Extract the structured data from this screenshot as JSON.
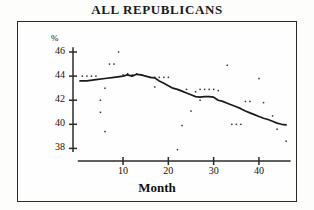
{
  "chart_data": {
    "type": "scatter",
    "title": "ALL REPUBLICANS",
    "xlabel": "Month",
    "ylabel": "%",
    "xlim": [
      0,
      48
    ],
    "ylim": [
      37.2,
      46.6
    ],
    "xticks": [
      10,
      20,
      30,
      40
    ],
    "yticks": [
      38,
      40,
      42,
      44,
      46
    ],
    "grid": false,
    "legend": null,
    "series": [
      {
        "name": "Monthly observations",
        "type": "scatter",
        "points": [
          [
            1,
            44.0
          ],
          [
            2,
            44.0
          ],
          [
            3,
            44.0
          ],
          [
            4,
            44.0
          ],
          [
            5,
            42.0
          ],
          [
            5,
            41.0
          ],
          [
            6,
            43.0
          ],
          [
            6,
            39.4
          ],
          [
            7,
            45.0
          ],
          [
            8,
            45.0
          ],
          [
            9,
            46.0
          ],
          [
            10,
            44.1
          ],
          [
            11,
            44.2
          ],
          [
            12,
            44.1
          ],
          [
            13,
            44.2
          ],
          [
            14,
            44.1
          ],
          [
            16,
            43.9
          ],
          [
            17,
            43.9
          ],
          [
            18,
            43.9
          ],
          [
            19,
            43.9
          ],
          [
            20,
            43.9
          ],
          [
            17,
            43.1
          ],
          [
            22,
            37.9
          ],
          [
            23,
            39.9
          ],
          [
            24,
            42.9
          ],
          [
            25,
            41.1
          ],
          [
            26,
            42.7
          ],
          [
            27,
            42.9
          ],
          [
            28,
            42.9
          ],
          [
            29,
            42.9
          ],
          [
            30,
            42.9
          ],
          [
            27,
            42.0
          ],
          [
            31,
            42.8
          ],
          [
            33,
            44.9
          ],
          [
            34,
            40.0
          ],
          [
            35,
            40.0
          ],
          [
            36,
            40.0
          ],
          [
            37,
            41.9
          ],
          [
            38,
            41.9
          ],
          [
            40,
            43.8
          ],
          [
            41,
            41.8
          ],
          [
            43,
            40.7
          ],
          [
            44,
            39.6
          ],
          [
            46,
            38.6
          ]
        ]
      },
      {
        "name": "Smoothed trend",
        "type": "line",
        "points": [
          [
            0.5,
            43.6
          ],
          [
            2,
            43.6
          ],
          [
            4,
            43.7
          ],
          [
            6,
            43.8
          ],
          [
            8,
            43.9
          ],
          [
            10,
            44.0
          ],
          [
            11,
            44.1
          ],
          [
            12,
            44.0
          ],
          [
            13,
            44.15
          ],
          [
            14,
            44.1
          ],
          [
            15,
            44.0
          ],
          [
            16,
            43.9
          ],
          [
            17,
            43.85
          ],
          [
            18,
            43.6
          ],
          [
            19,
            43.4
          ],
          [
            20,
            43.2
          ],
          [
            21,
            43.0
          ],
          [
            22,
            42.9
          ],
          [
            23,
            42.75
          ],
          [
            24,
            42.6
          ],
          [
            25,
            42.45
          ],
          [
            26,
            42.3
          ],
          [
            27,
            42.25
          ],
          [
            28,
            42.3
          ],
          [
            29,
            42.3
          ],
          [
            30,
            42.25
          ],
          [
            31,
            42.0
          ],
          [
            32,
            41.9
          ],
          [
            33,
            41.75
          ],
          [
            34,
            41.6
          ],
          [
            35,
            41.45
          ],
          [
            36,
            41.3
          ],
          [
            37,
            41.1
          ],
          [
            38,
            40.95
          ],
          [
            39,
            40.8
          ],
          [
            40,
            40.65
          ],
          [
            41,
            40.5
          ],
          [
            42,
            40.4
          ],
          [
            43,
            40.25
          ],
          [
            44,
            40.1
          ],
          [
            45,
            40.0
          ],
          [
            46,
            39.95
          ]
        ]
      }
    ]
  },
  "colors": {
    "axis": "#2b2b2b",
    "line": "#1a1a1a",
    "point": "#333333",
    "frame": "#2b2b2b",
    "background": "#fefefe"
  }
}
